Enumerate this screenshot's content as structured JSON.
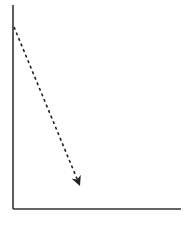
{
  "diagram": {
    "type": "axes-with-dashed-arrow",
    "colors": {
      "background": "#ffffff",
      "axis": "#333333",
      "arrow": "#222222"
    },
    "y_axis": {
      "x": 13,
      "y_start": 5,
      "y_end": 209
    },
    "x_axis": {
      "y": 209,
      "x_start": 13,
      "x_end": 181
    },
    "arrow": {
      "style": "dashed",
      "from": {
        "x": 14,
        "y": 27
      },
      "to": {
        "x": 80,
        "y": 186
      }
    }
  }
}
